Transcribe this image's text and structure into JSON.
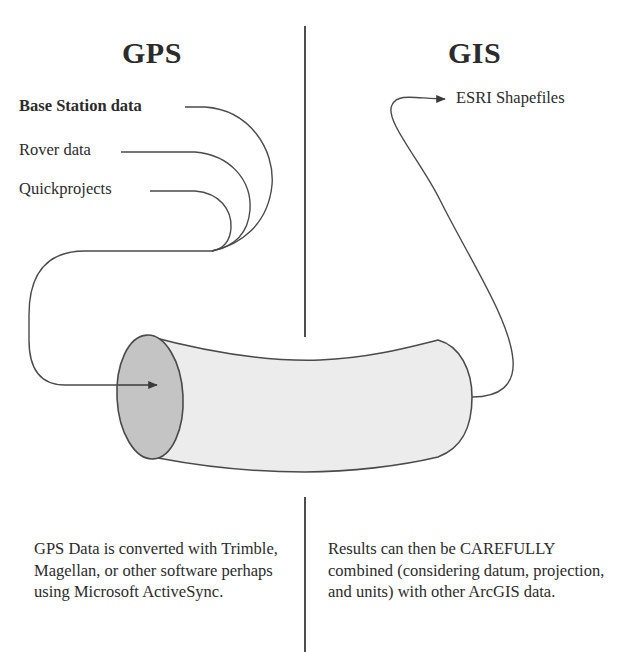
{
  "left_column": {
    "heading": "GPS",
    "sources": [
      {
        "label": "Base Station data",
        "bold": true
      },
      {
        "label": "Rover data",
        "bold": false
      },
      {
        "label": "Quickprojects",
        "bold": false
      }
    ],
    "description": "GPS Data is converted with Trimble, Magellan, or other software perhaps using Microsoft ActiveSync."
  },
  "right_column": {
    "heading": "GIS",
    "output": {
      "label": "ESRI Shapefiles"
    },
    "description": "Results can then be CAREFULLY combined (considering datum, projection, and units) with other ArcGIS data."
  },
  "colors": {
    "stroke": "#4a4a4a",
    "tube_body": "#ececec",
    "tube_face": "#c4c4c4",
    "text": "#2b2b2b"
  }
}
